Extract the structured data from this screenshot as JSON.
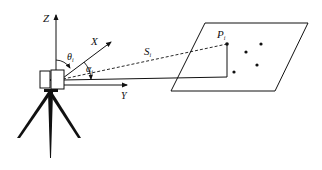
{
  "diagram": {
    "type": "laser-scanner-geometry",
    "axes": {
      "z": {
        "label": "Z"
      },
      "x": {
        "label": "X"
      },
      "y": {
        "label": "Y"
      }
    },
    "angles": {
      "theta": {
        "symbol": "θ",
        "subscript": "i"
      },
      "alpha": {
        "symbol": "α",
        "subscript": "i"
      }
    },
    "range": {
      "symbol": "S",
      "subscript": "i"
    },
    "point": {
      "symbol": "P",
      "subscript": "i"
    },
    "plane_points_count": 5,
    "colors": {
      "line": "#111111",
      "background": "#ffffff"
    }
  }
}
